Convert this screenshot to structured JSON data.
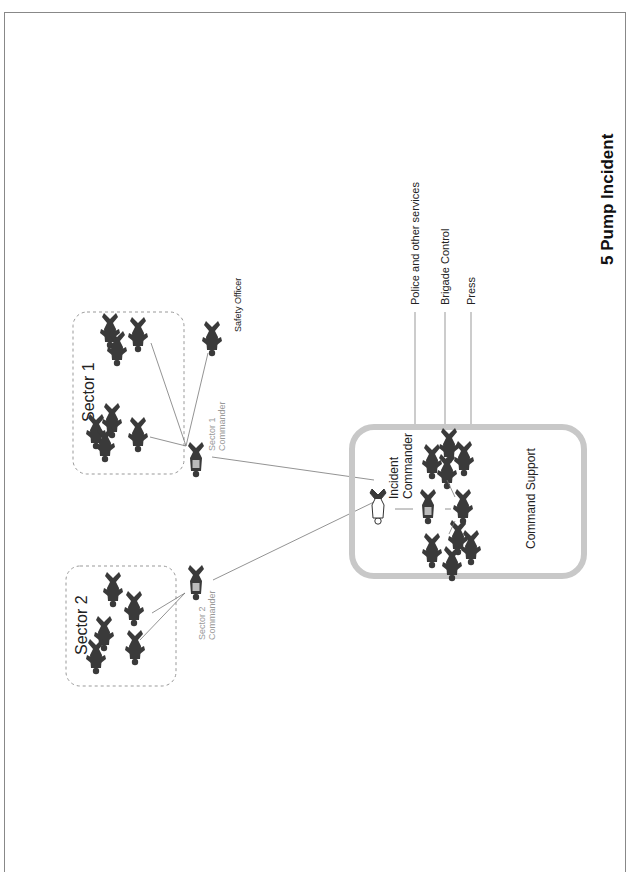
{
  "diagram": {
    "title": "5 Pump Incident",
    "external_links": [
      {
        "label": "Police and other services"
      },
      {
        "label": "Brigade Control"
      },
      {
        "label": "Press"
      }
    ],
    "sectors": [
      {
        "label": "Sector 1",
        "commander_line1": "Sector 1",
        "commander_line2": "Commander",
        "safety_officer": "Safety Officer"
      },
      {
        "label": "Sector 2",
        "commander_line1": "Sector 2",
        "commander_line2": "Commander"
      }
    ],
    "command_support": {
      "label": "Command Support",
      "incident_commander_line1": "Incident",
      "incident_commander_line2": "Commander"
    },
    "colors": {
      "figure": "#3a3a3a",
      "command_border": "#c8c8c8",
      "sector_border": "#999999",
      "line": "#777777"
    }
  }
}
